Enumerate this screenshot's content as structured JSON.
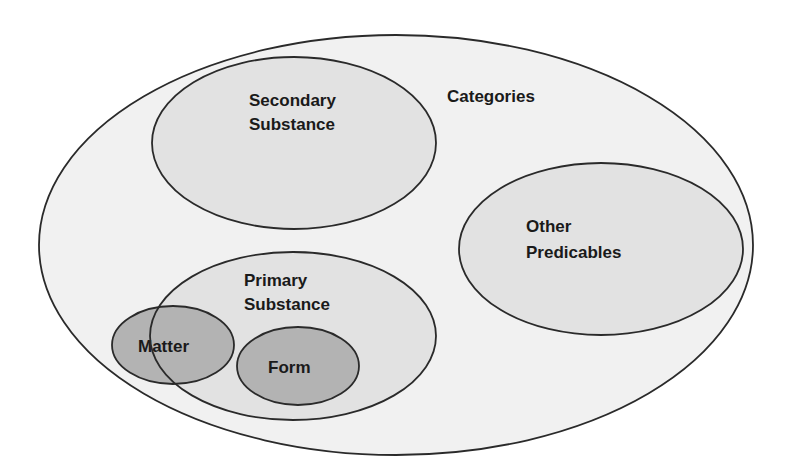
{
  "diagram": {
    "title": "Categories",
    "colors": {
      "background": "#ffffff",
      "outer_fill": "#f1f1f1",
      "inner_fill": "#e2e2e2",
      "dark_fill": "#b3b3b3",
      "stroke": "#2a2a2a",
      "text": "#1a1a1a"
    },
    "sets": {
      "categories": {
        "label": "Categories"
      },
      "secondary_substance": {
        "line1": "Secondary",
        "line2": "Substance"
      },
      "other_predicables": {
        "line1": "Other",
        "line2": "Predicables"
      },
      "primary_substance": {
        "line1": "Primary",
        "line2": "Substance"
      },
      "matter": {
        "label": "Matter"
      },
      "form": {
        "label": "Form"
      }
    },
    "relations": [
      "Secondary Substance is inside Categories",
      "Other Predicables is inside Categories",
      "Primary Substance is inside Categories",
      "Form is inside Primary Substance",
      "Matter partially overlaps Primary Substance"
    ]
  }
}
